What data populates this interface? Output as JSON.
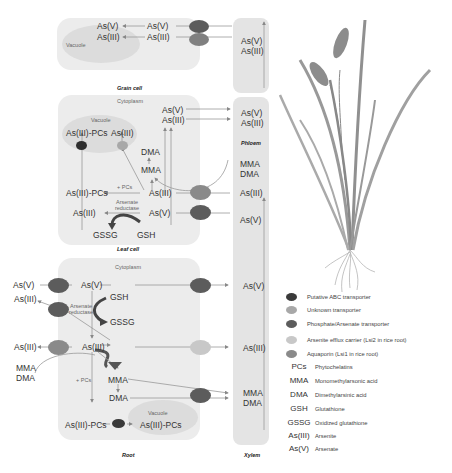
{
  "grain_cell": {
    "caption": "Grain cell",
    "vacuole_label": "Vacuole",
    "vac_as5": "As(V)",
    "vac_as3": "As(III)",
    "cyt_as5": "As(V)",
    "cyt_as3": "As(III)"
  },
  "phloem": {
    "caption": "Phloem",
    "top_as5": "As(V)",
    "top_as3": "As(III)",
    "bottom_as5": "As(V)",
    "bottom_as3": "As(III)"
  },
  "leaf_cell": {
    "caption": "Leaf cell",
    "cytoplasm_label": "Cytoplasm",
    "vacuole_label": "Vacuole",
    "vac_as3pcs": "As(III)-PCs",
    "vac_as3": "As(III)",
    "as5_top": "As(V)",
    "as3_top": "As(III)",
    "dma": "DMA",
    "mma": "MMA",
    "pcs": "+ PCs",
    "as3pcs": "As(III)-PCs",
    "as3_mid": "As(III)",
    "arsenate_reductase": "Arsenate reductase",
    "as3_low": "As(III)",
    "as5_low": "As(V)",
    "gssg": "GSSG",
    "gsh": "GSH"
  },
  "xylem": {
    "caption": "Xylem",
    "mma": "MMA",
    "dma": "DMA",
    "as3_top": "As(III)",
    "as5_top": "As(V)",
    "as5_mid": "As(V)",
    "as3_mid": "As(III)",
    "mma_low": "MMA",
    "dma_low": "DMA"
  },
  "root": {
    "caption": "Root",
    "cytoplasm_label": "Cytoplasm",
    "ext_as5": "As(V)",
    "ext_as3_top": "As(III)",
    "ext_as3": "As(III)",
    "ext_mma": "MMA",
    "ext_dma": "DMA",
    "as5": "As(V)",
    "gsh": "GSH",
    "gssg": "GSSG",
    "arsenate_reductase": "Arsenate reductase",
    "as3": "As(III)",
    "pcs": "+ PCs",
    "mma": "MMA",
    "dma": "DMA",
    "as3pcs": "As(III)-PCs",
    "vacuole_label": "Vacuole",
    "vac_as3pcs": "As(III)-PCs"
  },
  "legend": {
    "items": [
      {
        "label": "Putative ABC transporter",
        "color": "#3a3a3a"
      },
      {
        "label": "Unknown transporter",
        "color": "#a8a8a8"
      },
      {
        "label": "Phosphate/Arsenate transporter",
        "color": "#5c5c5c"
      },
      {
        "label": "Arsenite efflux carrier (Lsi2 in rice root)",
        "color": "#c8c8c8"
      },
      {
        "label": "Aquaporin (Lsi1 in rice root)",
        "color": "#8a8a8a"
      }
    ],
    "abbreviations": [
      {
        "abbr": "PCs",
        "definition": "Phytochelatins"
      },
      {
        "abbr": "MMA",
        "definition": "Monomethylarsonic acid"
      },
      {
        "abbr": "DMA",
        "definition": "Dimethylarsinic acid"
      },
      {
        "abbr": "GSH",
        "definition": "Glutathione"
      },
      {
        "abbr": "GSSG",
        "definition": "Oxidized glutathione"
      },
      {
        "abbr": "As(III)",
        "definition": "Arsenite"
      },
      {
        "abbr": "As(V)",
        "definition": "Arsenate"
      }
    ]
  },
  "colors": {
    "abc": "#3a3a3a",
    "unknown": "#a8a8a8",
    "phosphate": "#5c5c5c",
    "efflux": "#c8c8c8",
    "aquaporin": "#8a8a8a",
    "plant": "#8c8c8c"
  }
}
